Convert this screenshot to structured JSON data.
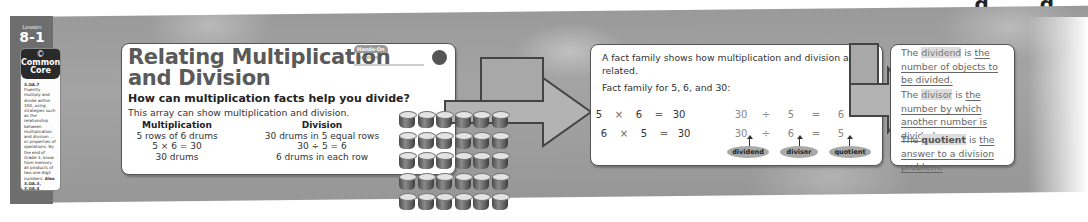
{
  "top_cut_text": "g g",
  "lesson": {
    "label": "Lesson",
    "number": "8-1",
    "standard_symbol": "©",
    "standard_title_line1": "Common",
    "standard_title_line2": "Core",
    "standard_code": "3.OA.7",
    "standard_text": "Fluently multiply and divide within 100, using strategies such as the relationship between multiplication and division ... or properties of operations. By the end of Grade 3, know from memory all products of two one-digit numbers.",
    "also_label": "Also",
    "also_codes": "3.OA.3, 3.OA.4"
  },
  "card1": {
    "title_line1": "Relating Multiplication",
    "title_line2": "and Division",
    "hands_on_badge": "Hands-On",
    "hands_on_material": "counters",
    "question": "How can multiplication facts help you divide?",
    "intro": "This array can show multiplication and division.",
    "multiplication": {
      "heading": "Multiplication",
      "lines": [
        "5 rows of 6 drums",
        "5 × 6 = 30",
        "30 drums"
      ]
    },
    "division": {
      "heading": "Division",
      "lines": [
        "30 drums in 5 equal rows",
        "30 ÷ 5 = 6",
        "6 drums in each row"
      ]
    },
    "array": {
      "rows": 5,
      "columns": 6,
      "item": "drum-icon"
    }
  },
  "card2": {
    "intro": "A fact family shows how multiplication and division are related.",
    "family_label": "Fact family for 5, 6, and 30:",
    "multiplication_facts": [
      [
        "5",
        "×",
        "6",
        "=",
        "30"
      ],
      [
        "6",
        "×",
        "5",
        "=",
        "30"
      ]
    ],
    "division_facts": [
      [
        "30",
        "÷",
        "5",
        "=",
        "6"
      ],
      [
        "30",
        "÷",
        "6",
        "=",
        "5"
      ]
    ],
    "labels": [
      "dividend",
      "divisor",
      "quotient"
    ]
  },
  "card3": {
    "definitions": [
      {
        "prefix": "The ",
        "term": "dividend",
        "middle": " is ",
        "definition": "the number of objects to be divided."
      },
      {
        "prefix": "The ",
        "term": "divisor",
        "middle": " is ",
        "definition": "the number by which another number is divided."
      },
      {
        "prefix": "The ",
        "term": "quotient",
        "middle": " is ",
        "definition": "the answer to a division problem."
      }
    ]
  },
  "colors": {
    "band": "#9e9e9e",
    "lesson_tab": "#6e6e6e",
    "card_border": "#555555",
    "arrow_fill": "#b3b3b3",
    "tag_fill": "#a9a9a9"
  }
}
